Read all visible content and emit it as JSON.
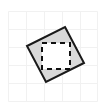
{
  "figure": {
    "canvas": {
      "width": 102,
      "height": 105,
      "background_color": "#ffffff"
    },
    "grid": {
      "name": "graph-paper-grid",
      "line_color": "#f1f1f1",
      "line_width": 1,
      "spacing": 18,
      "vertical_lines_x": [
        8,
        26,
        44,
        62,
        80,
        97
      ],
      "horizontal_lines_y": [
        11,
        29,
        47,
        65,
        83,
        101
      ]
    },
    "rotated_square": {
      "name": "tilted-square",
      "stroke_color": "#1a1a1a",
      "stroke_width": 2,
      "fill_color": "#d9d9d9",
      "points": "65,27 84,63 46,82 27,46",
      "vertices": [
        {
          "label": "top",
          "x": 65,
          "y": 27
        },
        {
          "label": "right",
          "x": 84,
          "y": 63
        },
        {
          "label": "bottom",
          "x": 46,
          "y": 82
        },
        {
          "label": "left",
          "x": 27,
          "y": 46
        }
      ]
    },
    "dashed_square": {
      "name": "inner-dashed-square",
      "stroke_color": "#111111",
      "stroke_width": 2,
      "fill_color": "#ffffff",
      "dash_pattern": "5 4",
      "x": 42,
      "y": 43,
      "width": 28,
      "height": 26
    }
  }
}
